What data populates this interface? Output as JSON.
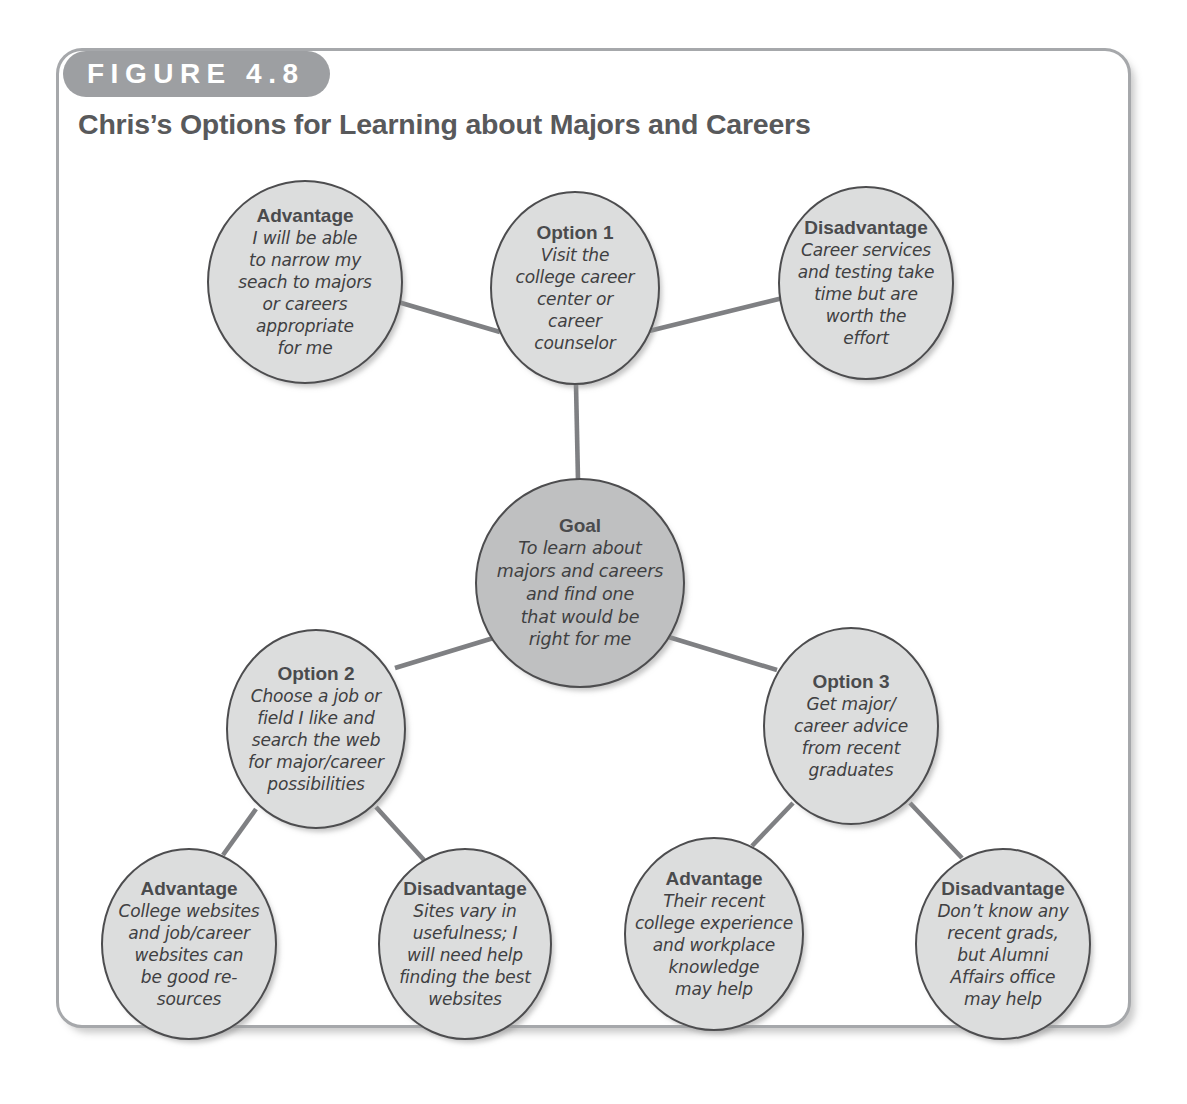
{
  "figure": {
    "badge": "FIGURE 4.8",
    "title": "Chris’s Options for Learning about Majors and Careers"
  },
  "colors": {
    "frame_border": "#a6a8ab",
    "badge_bg": "#9d9fa2",
    "title_text": "#58595b",
    "node_fill": "#dcdddd",
    "goal_fill": "#bfc0c1",
    "node_border": "#4d4d4f",
    "edge": "#7f8083"
  },
  "diagram": {
    "type": "decision-tree",
    "nodes": [
      {
        "id": "adv1",
        "role": "advantage",
        "title": "Advantage",
        "body": "I will be able\nto narrow my\nseach to majors\nor careers\nappropriate\nfor me",
        "cx": 305,
        "cy": 282,
        "rx": 98,
        "ry": 102,
        "fill": "#dcdddd"
      },
      {
        "id": "option1",
        "role": "option",
        "title": "Option 1",
        "body": "Visit the\ncollege career\ncenter or\ncareer\ncounselor",
        "cx": 575,
        "cy": 288,
        "rx": 85,
        "ry": 97,
        "fill": "#dcdddd"
      },
      {
        "id": "dis1",
        "role": "disadvantage",
        "title": "Disadvantage",
        "body": "Career services\nand testing take\ntime but are\nworth the\neffort",
        "cx": 866,
        "cy": 283,
        "rx": 88,
        "ry": 97,
        "fill": "#dcdddd"
      },
      {
        "id": "goal",
        "role": "goal",
        "title": "Goal",
        "body": "To learn about\nmajors and careers\nand find one\nthat would be\nright for me",
        "cx": 580,
        "cy": 583,
        "rx": 105,
        "ry": 105,
        "fill": "#bfc0c1"
      },
      {
        "id": "option2",
        "role": "option",
        "title": "Option 2",
        "body": "Choose a job or\nfield I like and\nsearch the web\nfor major/career\npossibilities",
        "cx": 316,
        "cy": 729,
        "rx": 90,
        "ry": 100,
        "fill": "#dcdddd"
      },
      {
        "id": "option3",
        "role": "option",
        "title": "Option 3",
        "body": "Get major/\ncareer advice\nfrom recent\ngraduates",
        "cx": 851,
        "cy": 726,
        "rx": 88,
        "ry": 99,
        "fill": "#dcdddd"
      },
      {
        "id": "adv2",
        "role": "advantage",
        "title": "Advantage",
        "body": "College websites\nand job/career\nwebsites can\nbe good re-\nsources",
        "cx": 189,
        "cy": 944,
        "rx": 88,
        "ry": 96,
        "fill": "#dcdddd"
      },
      {
        "id": "dis2",
        "role": "disadvantage",
        "title": "Disadvantage",
        "body": "Sites vary in\nusefulness; I\nwill need help\nfinding the best\nwebsites",
        "cx": 465,
        "cy": 944,
        "rx": 87,
        "ry": 96,
        "fill": "#dcdddd"
      },
      {
        "id": "adv3",
        "role": "advantage",
        "title": "Advantage",
        "body": "Their recent\ncollege experience\nand workplace\nknowledge\nmay help",
        "cx": 714,
        "cy": 934,
        "rx": 90,
        "ry": 97,
        "fill": "#dcdddd"
      },
      {
        "id": "dis3",
        "role": "disadvantage",
        "title": "Disadvantage",
        "body": "Don’t know any\nrecent grads,\nbut Alumni\nAffairs office\nmay help",
        "cx": 1003,
        "cy": 944,
        "rx": 88,
        "ry": 96,
        "fill": "#dcdddd"
      }
    ],
    "edges": [
      {
        "from": "adv1",
        "to": "option1",
        "x1": 398,
        "y1": 302,
        "x2": 500,
        "y2": 332
      },
      {
        "from": "option1",
        "to": "dis1",
        "x1": 649,
        "y1": 331,
        "x2": 787,
        "y2": 297
      },
      {
        "from": "option1",
        "to": "goal",
        "x1": 576,
        "y1": 385,
        "x2": 578,
        "y2": 480
      },
      {
        "from": "goal",
        "to": "option2",
        "x1": 500,
        "y1": 636,
        "x2": 395,
        "y2": 668
      },
      {
        "from": "goal",
        "to": "option3",
        "x1": 662,
        "y1": 635,
        "x2": 777,
        "y2": 670
      },
      {
        "from": "option2",
        "to": "adv2",
        "x1": 256,
        "y1": 809,
        "x2": 223,
        "y2": 855
      },
      {
        "from": "option2",
        "to": "dis2",
        "x1": 376,
        "y1": 807,
        "x2": 424,
        "y2": 860
      },
      {
        "from": "option3",
        "to": "adv3",
        "x1": 793,
        "y1": 803,
        "x2": 752,
        "y2": 846
      },
      {
        "from": "option3",
        "to": "dis3",
        "x1": 910,
        "y1": 803,
        "x2": 962,
        "y2": 858
      }
    ]
  }
}
